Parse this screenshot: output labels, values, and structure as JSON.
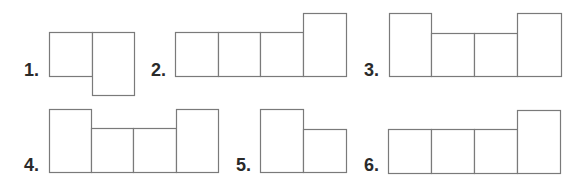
{
  "options": [
    {
      "label": "1.",
      "x": 24,
      "y": 61,
      "cells": [
        [
          49,
          32,
          43,
          44
        ],
        [
          92,
          32,
          42,
          63
        ]
      ]
    },
    {
      "label": "2.",
      "x": 151,
      "y": 61,
      "cells": [
        [
          175,
          32,
          43,
          44
        ],
        [
          218,
          32,
          42,
          44
        ],
        [
          260,
          32,
          43,
          44
        ],
        [
          303,
          13,
          43,
          63
        ]
      ]
    },
    {
      "label": "3.",
      "x": 364,
      "y": 61,
      "cells": [
        [
          389,
          13,
          42,
          63
        ],
        [
          431,
          33,
          43,
          43
        ],
        [
          474,
          33,
          43,
          43
        ],
        [
          517,
          13,
          44,
          63
        ]
      ]
    },
    {
      "label": "4.",
      "x": 24,
      "y": 156,
      "cells": [
        [
          49,
          109,
          42,
          63
        ],
        [
          91,
          128,
          42,
          44
        ],
        [
          133,
          128,
          43,
          44
        ],
        [
          176,
          109,
          42,
          63
        ]
      ]
    },
    {
      "label": "5.",
      "x": 236,
      "y": 156,
      "cells": [
        [
          260,
          109,
          43,
          63
        ],
        [
          303,
          129,
          43,
          43
        ]
      ]
    },
    {
      "label": "6.",
      "x": 364,
      "y": 156,
      "cells": [
        [
          388,
          129,
          43,
          44
        ],
        [
          431,
          129,
          43,
          44
        ],
        [
          474,
          129,
          43,
          44
        ],
        [
          517,
          110,
          43,
          63
        ]
      ]
    }
  ],
  "colors": {
    "stroke": "#7a7a7a",
    "label": "#2a2a2a",
    "background": "#ffffff"
  }
}
